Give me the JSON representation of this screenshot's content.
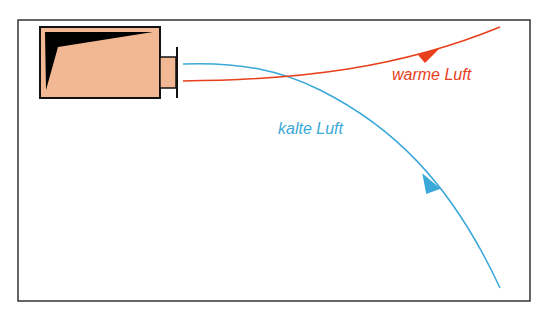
{
  "diagram": {
    "labels": {
      "warm": "warme Luft",
      "cold": "kalte Luft"
    },
    "colors": {
      "warm": "#e8401c",
      "cold": "#3aa8d8",
      "device_fill": "#f2b894",
      "frame": "#333333"
    }
  }
}
